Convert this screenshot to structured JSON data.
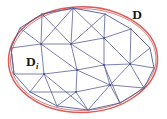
{
  "figure": {
    "type": "diagram",
    "width": 167,
    "height": 119,
    "background_color": "#ffffff"
  },
  "labels": {
    "domain": {
      "text": "D",
      "subscript": "",
      "x": 137,
      "y": 19,
      "meaning": "smooth curved domain boundary"
    },
    "subdomain": {
      "text": "D",
      "subscript": "i",
      "x": 27,
      "y": 66,
      "meaning": "individual triangular element of the mesh"
    }
  },
  "colors": {
    "smooth_boundary": "#d9534f",
    "smooth_boundary_alt": "#c0504d",
    "mesh_edge": "#5b5f96",
    "mesh_edge_light": "#6f74a8",
    "polygon_boundary": "#4a4f8c",
    "label_color": "#1a1a1a",
    "background": "#ffffff"
  },
  "geometry": {
    "smooth_boundary_description": "closed smooth oval curve, drawn in red, circumscribing the polygon",
    "smooth_boundary_path": "M 8,60 C 8,34 34,9 79,7 C 120,5 157,28 158,57 C 159,86 124,112 82,112 C 40,112 8,88 8,60 Z",
    "polygon_vertices": [
      {
        "id": "p0",
        "x": 11,
        "y": 48
      },
      {
        "id": "p1",
        "x": 20,
        "y": 28
      },
      {
        "id": "p2",
        "x": 42,
        "y": 14
      },
      {
        "id": "p3",
        "x": 73,
        "y": 8
      },
      {
        "id": "p4",
        "x": 105,
        "y": 14
      },
      {
        "id": "p5",
        "x": 131,
        "y": 29
      },
      {
        "id": "p6",
        "x": 150,
        "y": 48
      },
      {
        "id": "p7",
        "x": 154,
        "y": 68
      },
      {
        "id": "p8",
        "x": 144,
        "y": 88
      },
      {
        "id": "p9",
        "x": 120,
        "y": 103
      },
      {
        "id": "p10",
        "x": 88,
        "y": 110
      },
      {
        "id": "p11",
        "x": 57,
        "y": 106
      },
      {
        "id": "p12",
        "x": 30,
        "y": 92
      },
      {
        "id": "p13",
        "x": 14,
        "y": 74
      }
    ],
    "interior_vertices": [
      {
        "id": "i0",
        "x": 41,
        "y": 44
      },
      {
        "id": "i1",
        "x": 71,
        "y": 44
      },
      {
        "id": "i2",
        "x": 104,
        "y": 38
      },
      {
        "id": "i3",
        "x": 44,
        "y": 74
      },
      {
        "id": "i4",
        "x": 77,
        "y": 70
      },
      {
        "id": "i5",
        "x": 104,
        "y": 65
      },
      {
        "id": "i6",
        "x": 130,
        "y": 64
      },
      {
        "id": "i7",
        "x": 76,
        "y": 92
      },
      {
        "id": "i8",
        "x": 110,
        "y": 85
      }
    ],
    "mesh_edge_count": 44,
    "triangle_count": 30
  },
  "mesh_edges": [
    [
      "p0",
      "p1"
    ],
    [
      "p1",
      "p2"
    ],
    [
      "p2",
      "p3"
    ],
    [
      "p3",
      "p4"
    ],
    [
      "p4",
      "p5"
    ],
    [
      "p5",
      "p6"
    ],
    [
      "p6",
      "p7"
    ],
    [
      "p7",
      "p8"
    ],
    [
      "p8",
      "p9"
    ],
    [
      "p9",
      "p10"
    ],
    [
      "p10",
      "p11"
    ],
    [
      "p11",
      "p12"
    ],
    [
      "p12",
      "p13"
    ],
    [
      "p13",
      "p0"
    ],
    [
      "p0",
      "i0"
    ],
    [
      "p1",
      "i0"
    ],
    [
      "p2",
      "i0"
    ],
    [
      "p2",
      "i1"
    ],
    [
      "p3",
      "i1"
    ],
    [
      "p3",
      "i2"
    ],
    [
      "p4",
      "i2"
    ],
    [
      "p5",
      "i2"
    ],
    [
      "p5",
      "i6"
    ],
    [
      "p6",
      "i6"
    ],
    [
      "p7",
      "i6"
    ],
    [
      "p8",
      "i6"
    ],
    [
      "p8",
      "i8"
    ],
    [
      "p9",
      "i8"
    ],
    [
      "p9",
      "p8"
    ],
    [
      "p10",
      "i8"
    ],
    [
      "p10",
      "i7"
    ],
    [
      "p11",
      "i7"
    ],
    [
      "p11",
      "i3"
    ],
    [
      "p12",
      "i3"
    ],
    [
      "p13",
      "i3"
    ],
    [
      "p0",
      "p13"
    ],
    [
      "p13",
      "i3"
    ],
    [
      "i0",
      "i1"
    ],
    [
      "i1",
      "i2"
    ],
    [
      "i0",
      "i3"
    ],
    [
      "i1",
      "i4"
    ],
    [
      "i2",
      "i5"
    ],
    [
      "i3",
      "i4"
    ],
    [
      "i4",
      "i5"
    ],
    [
      "i5",
      "i6"
    ],
    [
      "i4",
      "i7"
    ],
    [
      "i5",
      "i8"
    ],
    [
      "i7",
      "i8"
    ],
    [
      "i0",
      "i4"
    ],
    [
      "i1",
      "i5"
    ],
    [
      "i2",
      "i6"
    ],
    [
      "i3",
      "p11"
    ],
    [
      "i4",
      "i8"
    ],
    [
      "i7",
      "p12"
    ]
  ]
}
